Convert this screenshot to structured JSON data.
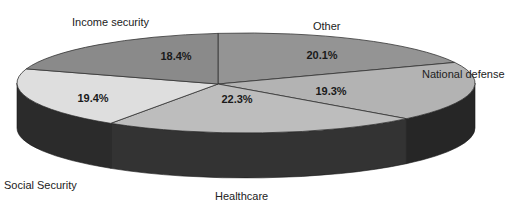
{
  "chart_data": {
    "type": "pie",
    "style": "3d",
    "title": "",
    "slices": [
      {
        "label": "Income security",
        "value": 18.4,
        "value_label": "18.4%",
        "color": "#8a8a8a"
      },
      {
        "label": "Other",
        "value": 20.1,
        "value_label": "20.1%",
        "color": "#949494"
      },
      {
        "label": "National defense",
        "value": 19.3,
        "value_label": "19.3%",
        "color": "#b3b3b3"
      },
      {
        "label": "Healthcare",
        "value": 22.3,
        "value_label": "22.3%",
        "color": "#bdbdbd"
      },
      {
        "label": "Social Security",
        "value": 19.4,
        "value_label": "19.4%",
        "color": "#dedede"
      }
    ],
    "side_colors": {
      "dark": "#2a2a2a",
      "mid": "#3a3a3a"
    },
    "legend": "labels-outside"
  }
}
